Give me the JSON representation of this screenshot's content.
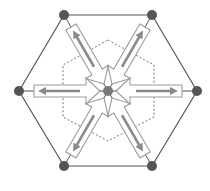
{
  "diagram": {
    "title": "",
    "colors": {
      "outer_hexagon": "#555555",
      "inner_dashed_hexagon": "#666666",
      "big_arrow_outline": "#9a9a9a",
      "small_arrow_fill": "#8a8a8a",
      "vertex_node": "#555555",
      "center_node": "#7a7a7a"
    },
    "center": {
      "x": 108,
      "y": 91
    },
    "outer_hexagon_vertices": [
      {
        "name": "top-left",
        "x": 64,
        "y": 15
      },
      {
        "name": "top-right",
        "x": 152,
        "y": 15
      },
      {
        "name": "right",
        "x": 197,
        "y": 91
      },
      {
        "name": "bottom-right",
        "x": 152,
        "y": 166
      },
      {
        "name": "bottom-left",
        "x": 64,
        "y": 166
      },
      {
        "name": "left",
        "x": 19,
        "y": 91
      }
    ],
    "inner_hexagon_style": "dashed",
    "arrows": [
      {
        "from": "vertex",
        "to": "center",
        "outer_arrow": "inward hollow",
        "inner_arrow": "outward solid",
        "vertex": "top-left"
      },
      {
        "from": "vertex",
        "to": "center",
        "outer_arrow": "inward hollow",
        "inner_arrow": "outward solid",
        "vertex": "top-right"
      },
      {
        "from": "vertex",
        "to": "center",
        "outer_arrow": "inward hollow",
        "inner_arrow": "outward solid",
        "vertex": "right"
      },
      {
        "from": "vertex",
        "to": "center",
        "outer_arrow": "inward hollow",
        "inner_arrow": "outward solid",
        "vertex": "bottom-right"
      },
      {
        "from": "vertex",
        "to": "center",
        "outer_arrow": "inward hollow",
        "inner_arrow": "outward solid",
        "vertex": "bottom-left"
      },
      {
        "from": "vertex",
        "to": "center",
        "outer_arrow": "inward hollow",
        "inner_arrow": "outward solid",
        "vertex": "left"
      }
    ]
  }
}
